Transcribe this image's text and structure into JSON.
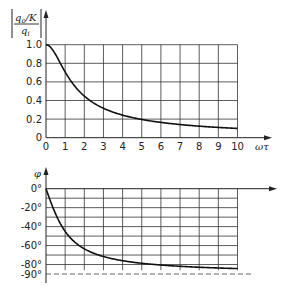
{
  "chart_data": [
    {
      "type": "line",
      "title": "",
      "ylabel": "|q_o/K / q_i|",
      "ylabel_parts": {
        "num": "q",
        "num_sub": "o",
        "num_tail": "/K",
        "den": "q",
        "den_sub": "i"
      },
      "xlabel": "ωτ",
      "xlim": [
        0,
        10
      ],
      "ylim": [
        0,
        1.0
      ],
      "grid": true,
      "x_ticks": [
        "0",
        "1",
        "2",
        "3",
        "4",
        "5",
        "6",
        "7",
        "8",
        "9",
        "10"
      ],
      "y_ticks": [
        "0",
        "0.2",
        "0.4",
        "0.6",
        "0.8",
        "1.0"
      ],
      "series": [
        {
          "name": "amplitude ratio",
          "x": [
            0,
            0.5,
            1,
            1.5,
            2,
            2.5,
            3,
            4,
            5,
            6,
            7,
            8,
            9,
            10
          ],
          "values": [
            1.0,
            0.89,
            0.71,
            0.55,
            0.45,
            0.37,
            0.32,
            0.24,
            0.2,
            0.16,
            0.14,
            0.12,
            0.11,
            0.1
          ]
        }
      ]
    },
    {
      "type": "line",
      "title": "",
      "ylabel": "φ",
      "xlabel": "",
      "xlim": [
        0,
        10
      ],
      "ylim": [
        -90,
        0
      ],
      "grid": true,
      "y_ticks": [
        "0°",
        "-20°",
        "-40°",
        "-60°",
        "-80°",
        "-90°"
      ],
      "asymptote": {
        "value": -90,
        "style": "dashed"
      },
      "series": [
        {
          "name": "phase",
          "x": [
            0,
            0.5,
            1,
            1.5,
            2,
            2.5,
            3,
            4,
            5,
            6,
            7,
            8,
            9,
            10
          ],
          "values": [
            0,
            -26.6,
            -45,
            -56.3,
            -63.4,
            -68.2,
            -71.6,
            -76,
            -78.7,
            -80.5,
            -81.9,
            -82.9,
            -83.7,
            -84.3
          ]
        }
      ]
    }
  ]
}
